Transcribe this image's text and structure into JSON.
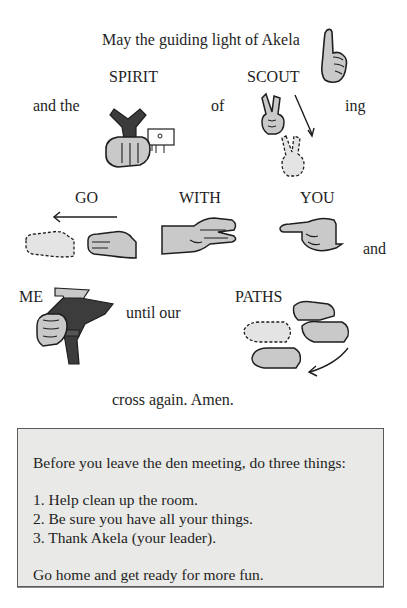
{
  "prayer": {
    "line1": "May the guiding light of Akela",
    "labels": {
      "spirit": "SPIRIT",
      "scout": "SCOUT",
      "go": "GO",
      "with": "WITH",
      "you": "YOU",
      "me": "ME",
      "paths": "PATHS"
    },
    "words": {
      "and_the": "and the",
      "of": "of",
      "ing": "ing",
      "and": "and",
      "until_our": "until our",
      "closing": "cross again. Amen."
    },
    "illustrations": [
      {
        "name": "akela-sign-hand",
        "depicts": "raised index finger"
      },
      {
        "name": "spirit-sign-hand",
        "depicts": "fist holding neckerchief over pocket"
      },
      {
        "name": "scout-sign-hands",
        "depicts": "two-finger scout sign moving down"
      },
      {
        "name": "go-sign-hands",
        "depicts": "flat hands moving left"
      },
      {
        "name": "with-sign-hands",
        "depicts": "clasped hands"
      },
      {
        "name": "you-sign-hand",
        "depicts": "pointing hand"
      },
      {
        "name": "me-sign-hand",
        "depicts": "fist on neckerchief at chest"
      },
      {
        "name": "paths-sign-hands",
        "depicts": "flat hands crossing with arrow"
      }
    ]
  },
  "reminder_box": {
    "intro": "Before you leave the den meeting, do three things:",
    "items": [
      "1. Help clean up the room.",
      "2. Be sure you have all your things.",
      "3. Thank Akela (your leader)."
    ],
    "closing": "Go home and get ready for more fun."
  },
  "colors": {
    "ink": "#1e1e1e",
    "hand_fill": "#c9c9c9",
    "scarf": "#3c3c3c",
    "box_bg": "#e9e9e7",
    "box_border": "#5a5a5a"
  }
}
